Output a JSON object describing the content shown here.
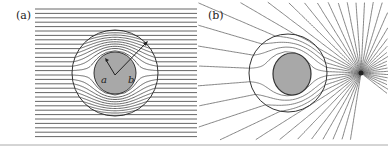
{
  "panels": [
    {
      "label": "(a)",
      "radius_labels": [
        "a",
        "b"
      ],
      "description": "Uniform flow lines bent around a cloaked sphere with inner radius a and outer radius b"
    },
    {
      "label": "(b)",
      "description": "Field lines from a point source bent around a cloaked sphere"
    }
  ],
  "colors": {
    "line": "#555555",
    "core": "#a8a8a8",
    "circle": "#333333",
    "bottom_rule": "#999999"
  }
}
